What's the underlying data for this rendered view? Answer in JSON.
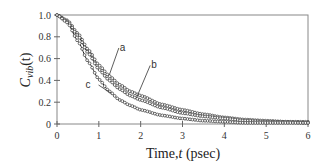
{
  "chart_data": {
    "type": "line",
    "title": "",
    "xlabel": "Time, t (psec)",
    "xlabel_parts": {
      "prefix": "Time,",
      "var": "t",
      "suffix": " (psec)"
    },
    "ylabel": "C_vib(t)",
    "ylabel_parts": {
      "main": "C",
      "sub": "vib",
      "arg": "(t)"
    },
    "xlim": [
      0,
      6
    ],
    "ylim": [
      0,
      1.0
    ],
    "xticks": [
      "0",
      "1",
      "2",
      "3",
      "4",
      "5",
      "6"
    ],
    "yticks": [
      "0",
      "0.2",
      "0.4",
      "0.6",
      "0.8",
      "1.0"
    ],
    "grid": false,
    "legend": "inline labels a, b, c with leader lines",
    "markers": "open circles overlaid on solid lines",
    "x": [
      0,
      0.25,
      0.5,
      0.75,
      1.0,
      1.25,
      1.5,
      1.75,
      2.0,
      2.5,
      3.0,
      3.5,
      4.0,
      4.5,
      5.0,
      5.5,
      6.0
    ],
    "series": [
      {
        "name": "a",
        "values": [
          1.0,
          0.95,
          0.83,
          0.68,
          0.54,
          0.44,
          0.36,
          0.3,
          0.26,
          0.18,
          0.13,
          0.09,
          0.06,
          0.04,
          0.03,
          0.02,
          0.02
        ]
      },
      {
        "name": "b",
        "values": [
          1.0,
          0.94,
          0.81,
          0.65,
          0.5,
          0.4,
          0.32,
          0.26,
          0.22,
          0.15,
          0.1,
          0.07,
          0.05,
          0.03,
          0.02,
          0.02,
          0.01
        ]
      },
      {
        "name": "c",
        "values": [
          1.0,
          0.93,
          0.76,
          0.57,
          0.41,
          0.3,
          0.22,
          0.17,
          0.13,
          0.08,
          0.05,
          0.03,
          0.02,
          0.01,
          0.01,
          0.01,
          0.01
        ]
      }
    ],
    "annotations": [
      {
        "text": "a",
        "label_xy": [
          1.55,
          0.67
        ],
        "point_xy": [
          1.25,
          0.45
        ]
      },
      {
        "text": "b",
        "label_xy": [
          2.3,
          0.51
        ],
        "point_xy": [
          1.9,
          0.24
        ]
      },
      {
        "text": "c",
        "label_xy": [
          0.85,
          0.33
        ],
        "point_xy": [
          1.3,
          0.28
        ]
      }
    ]
  }
}
